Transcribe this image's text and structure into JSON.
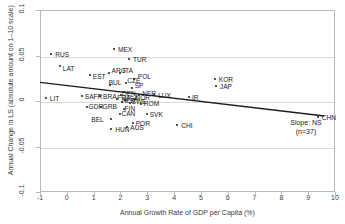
{
  "chart_data": {
    "type": "scatter",
    "title": "",
    "xlabel": "Annual Growth Rate of GDP per Capita (%)",
    "ylabel": "Annual Change in LS (absolute amount on 1–10 scale)",
    "xlim": [
      -1,
      10
    ],
    "ylim": [
      -0.1,
      0.1
    ],
    "xticks": [
      "-1",
      "0",
      "1",
      "2",
      "3",
      "4",
      "5",
      "6",
      "7",
      "8",
      "9",
      "10"
    ],
    "xtick_values": [
      -1,
      0,
      1,
      2,
      3,
      4,
      5,
      6,
      7,
      8,
      9,
      10
    ],
    "yticks": [
      "0.1",
      "0.05",
      "0",
      "-0.05",
      "-0.1"
    ],
    "ytick_values": [
      0.1,
      0.05,
      0,
      -0.05,
      -0.1
    ],
    "grid": true,
    "legend": false,
    "annotations": [
      {
        "text": "Slope: NS",
        "x": 8.3,
        "y": -0.042
      },
      {
        "text": "(n=37)",
        "x": 8.3,
        "y": -0.049
      }
    ],
    "trendline": {
      "type": "linear",
      "significance": "NS",
      "x_start": -1.0,
      "y_start": 0.0205,
      "x_end": 9.6,
      "y_end": -0.0165
    },
    "points": [
      {
        "label": "RUS",
        "x": -0.62,
        "y": 0.0522,
        "label_dx": 4,
        "label_dy": -3
      },
      {
        "label": "LAT",
        "x": -0.3,
        "y": 0.0392,
        "label_dx": 3,
        "label_dy": -1
      },
      {
        "label": "LIT",
        "x": -0.82,
        "y": 0.0048,
        "label_dx": 4,
        "label_dy": -3
      },
      {
        "label": "EST",
        "x": 0.82,
        "y": 0.0298,
        "label_dx": 3,
        "label_dy": -2
      },
      {
        "label": "MEX",
        "x": 1.72,
        "y": 0.0582,
        "label_dx": 4,
        "label_dy": -3
      },
      {
        "label": "TUR",
        "x": 2.28,
        "y": 0.0472,
        "label_dx": 4,
        "label_dy": -3
      },
      {
        "label": "ARG",
        "x": 1.52,
        "y": 0.0322,
        "label_dx": 3,
        "label_dy": -6
      },
      {
        "label": "ITA",
        "x": 1.95,
        "y": 0.0322,
        "label_dx": 3,
        "label_dy": -6
      },
      {
        "label": "POL",
        "x": 2.46,
        "y": 0.0258,
        "label_dx": 4,
        "label_dy": -6
      },
      {
        "label": "CZE",
        "x": 2.18,
        "y": 0.021,
        "label_dx": 1,
        "label_dy": -6
      },
      {
        "label": "BUL",
        "x": 1.56,
        "y": 0.0185,
        "label_dx": -1,
        "label_dy": -6
      },
      {
        "label": "SP",
        "x": 2.38,
        "y": 0.0158,
        "label_dx": 3,
        "label_dy": -6
      },
      {
        "label": "KOR",
        "x": 5.48,
        "y": 0.0252,
        "label_dx": 4,
        "label_dy": -3
      },
      {
        "label": "JAP",
        "x": 5.52,
        "y": 0.0175,
        "label_dx": 4,
        "label_dy": -3
      },
      {
        "label": "SAFR",
        "x": 0.52,
        "y": 0.0062,
        "label_dx": 3,
        "label_dy": -3
      },
      {
        "label": "BRA",
        "x": 1.2,
        "y": 0.0062,
        "label_dx": 3,
        "label_dy": -3
      },
      {
        "label": "DEN",
        "x": 1.98,
        "y": 0.0078,
        "label_dx": 1,
        "label_dy": -5
      },
      {
        "label": "NER",
        "x": 2.66,
        "y": 0.0082,
        "label_dx": 3,
        "label_dy": -5
      },
      {
        "label": "LUX",
        "x": 3.22,
        "y": 0.0078,
        "label_dx": 4,
        "label_dy": -3
      },
      {
        "label": "NLD",
        "x": 2.02,
        "y": 0.0005,
        "label_dx": 0,
        "label_dy": -5
      },
      {
        "label": "SWE",
        "x": 2.3,
        "y": -0.0015,
        "label_dx": 2,
        "label_dy": -5
      },
      {
        "label": "ROM",
        "x": 2.72,
        "y": -0.0022,
        "label_dx": 3,
        "label_dy": -4
      },
      {
        "label": "GDR",
        "x": 0.7,
        "y": -0.0055,
        "label_dx": 2,
        "label_dy": -4
      },
      {
        "label": "GRB",
        "x": 1.22,
        "y": -0.0055,
        "label_dx": 2,
        "label_dy": -4
      },
      {
        "label": "FIN",
        "x": 2.08,
        "y": -0.0075,
        "label_dx": 1,
        "label_dy": -4
      },
      {
        "label": "IR",
        "x": 4.52,
        "y": 0.0052,
        "label_dx": 3,
        "label_dy": -3
      },
      {
        "label": "CAN",
        "x": 1.96,
        "y": -0.0128,
        "label_dx": 1,
        "label_dy": -4
      },
      {
        "label": "SVK",
        "x": 2.94,
        "y": -0.0135,
        "label_dx": 3,
        "label_dy": -3
      },
      {
        "label": "BEL",
        "x": 1.62,
        "y": -0.0185,
        "label_dx": -20,
        "label_dy": -3
      },
      {
        "label": "POR",
        "x": 2.42,
        "y": -0.0232,
        "label_dx": 3,
        "label_dy": -3
      },
      {
        "label": "AUS",
        "x": 2.22,
        "y": -0.0272,
        "label_dx": 3,
        "label_dy": -3
      },
      {
        "label": "HUN",
        "x": 1.62,
        "y": -0.0302,
        "label_dx": 4,
        "label_dy": -3
      },
      {
        "label": "CHI",
        "x": 4.08,
        "y": -0.0252,
        "label_dx": 4,
        "label_dy": -3
      },
      {
        "label": "CHN",
        "x": 9.32,
        "y": -0.0165,
        "label_dx": 4,
        "label_dy": -3
      },
      {
        "label": "USA",
        "x": 2.12,
        "y": 0.0022,
        "label_dx": 0,
        "label_dy": -5
      },
      {
        "label": "NOR",
        "x": 2.52,
        "y": 0.0038,
        "label_dx": 0,
        "label_dy": -5
      },
      {
        "label": "FRA",
        "x": 1.84,
        "y": 0.0035,
        "label_dx": 0,
        "label_dy": -5
      }
    ]
  }
}
